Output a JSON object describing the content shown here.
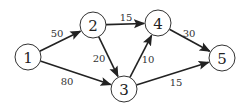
{
  "diagram": {
    "type": "directed-weighted-graph",
    "nodes": [
      {
        "id": "1",
        "label": "1",
        "x": 28,
        "y": 57
      },
      {
        "id": "2",
        "label": "2",
        "x": 93,
        "y": 25
      },
      {
        "id": "3",
        "label": "3",
        "x": 124,
        "y": 89
      },
      {
        "id": "4",
        "label": "4",
        "x": 158,
        "y": 23
      },
      {
        "id": "5",
        "label": "5",
        "x": 222,
        "y": 58
      }
    ],
    "edges": [
      {
        "from": "1",
        "to": "2",
        "weight": "50",
        "lx": 57,
        "ly": 33
      },
      {
        "from": "1",
        "to": "3",
        "weight": "80",
        "lx": 67,
        "ly": 81
      },
      {
        "from": "2",
        "to": "4",
        "weight": "15",
        "lx": 126,
        "ly": 17
      },
      {
        "from": "2",
        "to": "3",
        "weight": "20",
        "lx": 99,
        "ly": 58
      },
      {
        "from": "3",
        "to": "4",
        "weight": "10",
        "lx": 148,
        "ly": 59
      },
      {
        "from": "4",
        "to": "5",
        "weight": "30",
        "lx": 189,
        "ly": 33
      },
      {
        "from": "3",
        "to": "5",
        "weight": "15",
        "lx": 176,
        "ly": 82
      }
    ]
  }
}
